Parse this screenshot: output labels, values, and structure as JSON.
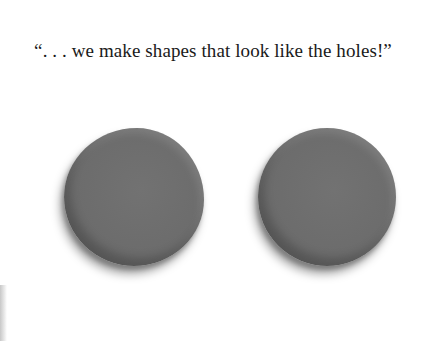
{
  "page": {
    "caption": "“. . . we make shapes that look like the holes!”",
    "illustration": {
      "shapes": [
        {
          "name": "left-round-shape",
          "color": "#6e6e6e"
        },
        {
          "name": "right-round-shape",
          "color": "#6e6e6e"
        }
      ]
    },
    "colors": {
      "background": "#ffffff",
      "text": "#1a1a1a",
      "shape": "#6e6e6e"
    }
  }
}
